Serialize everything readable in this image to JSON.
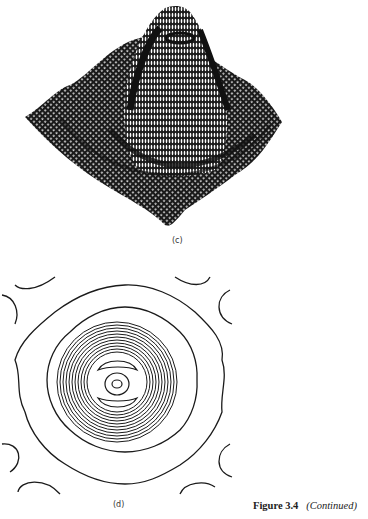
{
  "figure": {
    "number_label": "Figure 3.4",
    "continued_label": "(Continued)"
  },
  "subfigures": [
    {
      "label": "(c)",
      "type": "3d-mesh-surface",
      "description": "Wireframe surface plot with central peak and rippled surrounding plane"
    },
    {
      "label": "(d)",
      "type": "contour-plot",
      "description": "Concentric contours with dense rings around center, wavy outer contours, and corner arcs"
    }
  ],
  "colors": {
    "ink": "#1a1a1a",
    "paper": "#ffffff"
  }
}
